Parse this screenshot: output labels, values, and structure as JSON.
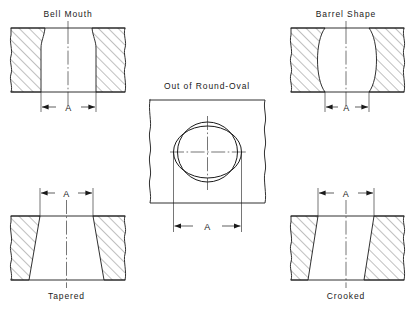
{
  "drawing": {
    "title_present": false,
    "line_color": "#1a1a1a",
    "background_color": "#ffffff",
    "dimension_letter": "A",
    "figures": [
      {
        "id": "bell-mouth",
        "label": "Bell Mouth",
        "label_position": "top",
        "dimension_label": "A",
        "dimension_position": "bottom",
        "description": "Cylinder bore cross-section flared open at the top"
      },
      {
        "id": "barrel-shape",
        "label": "Barrel Shape",
        "label_position": "top",
        "dimension_label": "A",
        "dimension_position": "bottom",
        "description": "Cylinder bore cross-section bulged outward at mid height"
      },
      {
        "id": "out-of-round-oval",
        "label": "Out of Round-Oval",
        "label_position": "top",
        "dimension_label": "A",
        "dimension_position": "bottom",
        "description": "Plan view of bore showing true circle overlaid by a wider oval"
      },
      {
        "id": "tapered",
        "label": "Tapered",
        "label_position": "bottom",
        "dimension_label": "A",
        "dimension_position": "top",
        "description": "Cylinder bore cross-section narrow at top widening toward bottom"
      },
      {
        "id": "crooked",
        "label": "Crooked",
        "label_position": "bottom",
        "dimension_label": "A",
        "dimension_position": "top",
        "description": "Cylinder bore cross-section with both walls slanted the same direction"
      }
    ]
  }
}
